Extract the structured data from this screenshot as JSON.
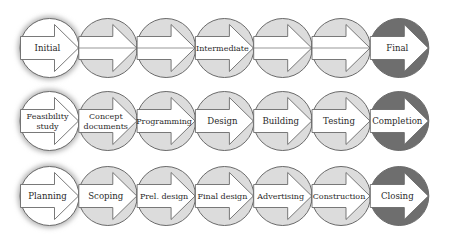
{
  "diagram": {
    "type": "process-phase-flow",
    "colors": {
      "start_fill": "#ffffff",
      "middle_fill": "#dcdcdc",
      "end_fill": "#6e6e6e",
      "arrow_fill": "#ffffff",
      "stroke": "#6a6a6a",
      "glow": "#b5b5b5",
      "text": "#2a2a2a"
    },
    "rows": [
      {
        "name": "generic-phases",
        "steps": [
          {
            "label": "Initial",
            "kind": "start"
          },
          {
            "label": "",
            "kind": "middle"
          },
          {
            "label": "",
            "kind": "middle"
          },
          {
            "label": "Intermediate",
            "kind": "middle"
          },
          {
            "label": "",
            "kind": "middle"
          },
          {
            "label": "",
            "kind": "middle"
          },
          {
            "label": "Final",
            "kind": "end"
          }
        ]
      },
      {
        "name": "project-phases",
        "steps": [
          {
            "label": "Feasibility study",
            "lines": [
              "Feasibility",
              "study"
            ],
            "kind": "start"
          },
          {
            "label": "Concept documents",
            "lines": [
              "Concept",
              "documents"
            ],
            "kind": "middle"
          },
          {
            "label": "Programming",
            "lines": [
              "Programming"
            ],
            "kind": "middle"
          },
          {
            "label": "Design",
            "lines": [
              "Design"
            ],
            "kind": "middle"
          },
          {
            "label": "Building",
            "lines": [
              "Building"
            ],
            "kind": "middle"
          },
          {
            "label": "Testing",
            "lines": [
              "Testing"
            ],
            "kind": "middle"
          },
          {
            "label": "Completion",
            "lines": [
              "Completion"
            ],
            "kind": "end"
          }
        ]
      },
      {
        "name": "construction-phases",
        "steps": [
          {
            "label": "Planning",
            "lines": [
              "Planning"
            ],
            "kind": "start"
          },
          {
            "label": "Scoping",
            "lines": [
              "Scoping"
            ],
            "kind": "middle"
          },
          {
            "label": "Prel. design",
            "lines": [
              "Prel. design"
            ],
            "kind": "middle"
          },
          {
            "label": "Final design",
            "lines": [
              "Final design"
            ],
            "kind": "middle"
          },
          {
            "label": "Advertising",
            "lines": [
              "Advertising"
            ],
            "kind": "middle"
          },
          {
            "label": "Construction",
            "lines": [
              "Construction"
            ],
            "kind": "middle"
          },
          {
            "label": "Closing",
            "lines": [
              "Closing"
            ],
            "kind": "end"
          }
        ]
      }
    ]
  }
}
